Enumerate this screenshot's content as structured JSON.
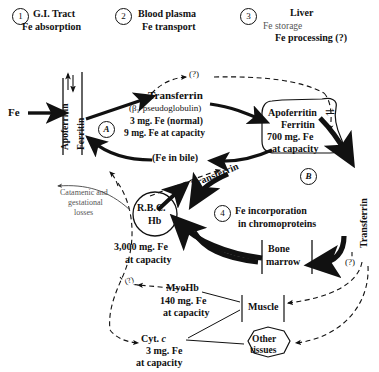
{
  "diagram": {
    "stages": [
      {
        "num": "1",
        "title": "G.I. Tract",
        "lines": [
          "Fe absorption"
        ]
      },
      {
        "num": "2",
        "title": "Blood plasma",
        "lines": [
          "Fe transport"
        ]
      },
      {
        "num": "3",
        "title": "Liver",
        "lines": [
          "(and other organs)",
          "Fe storage",
          "Fe processing (?)"
        ]
      },
      {
        "num": "4",
        "title": "Fe incorporation",
        "lines": [
          "in chromoproteins"
        ]
      }
    ],
    "nodes": {
      "fe_input": "Fe",
      "gut_wall_top": "Apoferritin",
      "gut_wall_bottom": "Ferritin",
      "transferrin_title": "Transferrin",
      "transferrin_sub": "(β₁-pseudoglobulin)",
      "transferrin_l1": "3 mg. Fe  (normal)",
      "transferrin_l2": "9 mg. Fe at capacity",
      "bile": "(Fe in bile)",
      "liver_l1": "Apoferritin",
      "liver_eq": "⇌",
      "liver_l2": "Ferritin",
      "liver_l3": "700 mg. Fe",
      "liver_l4": "at capacity",
      "rbc_l1": "R.B.C.",
      "rbc_l2": "Hb",
      "rbc_cap1": "3,000 mg. Fe",
      "rbc_cap2": "at capacity",
      "bone_l1": "Bone",
      "bone_l2": "marrow",
      "myohb": "MyoHb",
      "myohb_l1": "140 mg. Fe",
      "myohb_l2": "at capacity",
      "muscle": "Muscle",
      "cyt_c_pre": "Cyt. ",
      "cyt_c_ital": "c",
      "cyt_l1": "3 mg. Fe",
      "cyt_l2": "at capacity",
      "other_l1": "Other",
      "other_l2": "tissues",
      "losses_l1": "Catamenic and",
      "losses_l2": "gestational",
      "losses_l3": "losses"
    },
    "markers": {
      "a": "A",
      "b": "B"
    },
    "edge_labels": {
      "q_top": "(?)",
      "q_right": "(?)",
      "q_left": "(?)",
      "transferrin_left": "Transferrin",
      "transferrin_right": "Transferrin"
    },
    "colors": {
      "ink": "#111111",
      "faint": "#555555",
      "background": "#ffffff"
    }
  }
}
